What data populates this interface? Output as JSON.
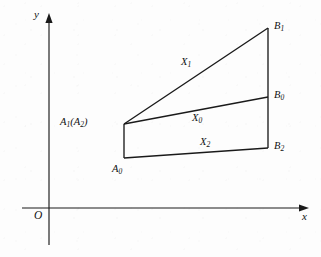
{
  "figure": {
    "kind": "geometry-diagram",
    "background_color": "#fdfdfd",
    "ink_color": "#1a1a1a",
    "width": 321,
    "height": 257
  },
  "axes": {
    "x_label": "x",
    "y_label": "y",
    "origin_label": "O",
    "x_axis": {
      "x1": 22,
      "y1": 208,
      "x2": 308,
      "y2": 208
    },
    "y_axis": {
      "x1": 49,
      "y1": 245,
      "x2": 49,
      "y2": 14
    }
  },
  "points": [
    {
      "id": "A0",
      "label_main": "A",
      "label_sub": "0",
      "x": 124,
      "y": 158,
      "label_x": 112,
      "label_y": 166
    },
    {
      "id": "A1A2",
      "label_main": "A",
      "label_sub": "1",
      "label_suffix_main": "A",
      "label_suffix_sub": "2",
      "x": 124,
      "y": 124,
      "label_x": 60,
      "label_y": 118
    },
    {
      "id": "B0",
      "label_main": "B",
      "label_sub": "0",
      "x": 268,
      "y": 97,
      "label_x": 273,
      "label_y": 90
    },
    {
      "id": "B1",
      "label_main": "B",
      "label_sub": "1",
      "x": 268,
      "y": 28,
      "label_x": 273,
      "label_y": 21
    },
    {
      "id": "B2",
      "label_main": "B",
      "label_sub": "2",
      "x": 268,
      "y": 148,
      "label_x": 273,
      "label_y": 142
    }
  ],
  "segments": [
    {
      "id": "A1-B1",
      "from": "A1A2",
      "to": "B1",
      "x1": 124,
      "y1": 124,
      "x2": 268,
      "y2": 28
    },
    {
      "id": "A1-B0",
      "from": "A1A2",
      "to": "B0",
      "x1": 124,
      "y1": 124,
      "x2": 268,
      "y2": 97
    },
    {
      "id": "A0-B2",
      "from": "A0",
      "to": "B2",
      "x1": 124,
      "y1": 158,
      "x2": 268,
      "y2": 148
    },
    {
      "id": "A0-A1",
      "from": "A0",
      "to": "A1A2",
      "x1": 124,
      "y1": 158,
      "x2": 124,
      "y2": 124
    },
    {
      "id": "B1-B2",
      "from": "B1",
      "to": "B2",
      "x1": 268,
      "y1": 28,
      "x2": 268,
      "y2": 148
    }
  ],
  "segment_labels": [
    {
      "id": "X1",
      "label_main": "X",
      "label_sub": "1",
      "x": 181,
      "y": 58,
      "for_segment": "A1-B1"
    },
    {
      "id": "X0",
      "label_main": "X",
      "label_sub": "0",
      "x": 192,
      "y": 114,
      "for_segment": "A1-B0"
    },
    {
      "id": "X2",
      "label_main": "X",
      "label_sub": "2",
      "x": 200,
      "y": 138,
      "for_segment": "A0-B2"
    }
  ]
}
